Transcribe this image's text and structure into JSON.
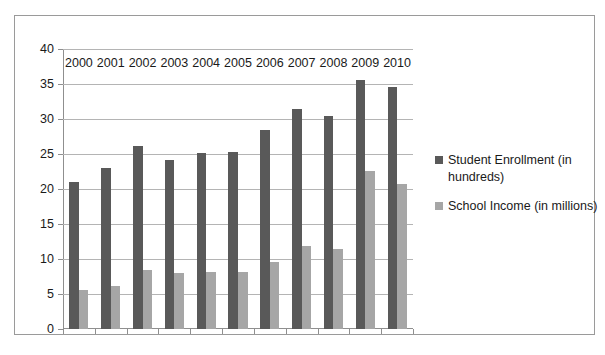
{
  "chart_data": {
    "type": "bar",
    "title": "",
    "xlabel": "",
    "ylabel": "",
    "categories": [
      "2000",
      "2001",
      "2002",
      "2003",
      "2004",
      "2005",
      "2006",
      "2007",
      "2008",
      "2009",
      "2010"
    ],
    "series": [
      {
        "name": "Student Enrollment (in hundreds)",
        "color": "#595959",
        "values": [
          21.0,
          23.0,
          26.1,
          24.2,
          25.2,
          25.3,
          28.4,
          31.4,
          30.5,
          35.6,
          34.6
        ]
      },
      {
        "name": "School Income (in millions)",
        "color": "#a6a6a6",
        "values": [
          5.6,
          6.2,
          8.5,
          8.0,
          8.2,
          8.2,
          9.6,
          11.9,
          11.4,
          22.6,
          20.7
        ]
      }
    ],
    "ylim": [
      0,
      40
    ],
    "yticks": [
      0,
      5,
      10,
      15,
      20,
      25,
      30,
      35,
      40
    ],
    "ytick_labels": [
      "0",
      "5",
      "10",
      "15",
      "20",
      "25",
      "30",
      "35",
      "40"
    ],
    "grid": true,
    "legend_position": "right",
    "plot_background": "#ffffff",
    "gridline_color": "#b4b4b4",
    "axis_color": "#8f8f8f",
    "border_color": "#9a9a9a"
  }
}
